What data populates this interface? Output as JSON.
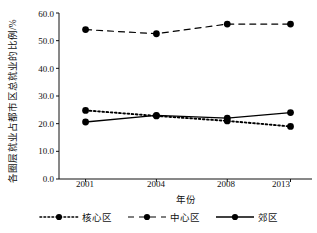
{
  "chart_data": {
    "type": "line",
    "title": "",
    "xlabel": "年份",
    "ylabel": "各圈层就业占都市区总就业的比例/%",
    "categories": [
      "2001",
      "2004",
      "2008",
      "2013"
    ],
    "ylim": [
      0.0,
      60.0
    ],
    "yticks": [
      "0.0",
      "10.0",
      "20.0",
      "30.0",
      "40.0",
      "50.0",
      "60.0"
    ],
    "ytick_values": [
      0.0,
      10.0,
      20.0,
      30.0,
      40.0,
      50.0,
      60.0
    ],
    "grid": false,
    "legend_position": "bottom",
    "marker": "filled-circle",
    "series": [
      {
        "name": "核心区",
        "line_style": "dotted",
        "color": "#000000",
        "values": [
          24.8,
          22.8,
          21.0,
          19.0
        ]
      },
      {
        "name": "中心区",
        "line_style": "dashed",
        "color": "#000000",
        "values": [
          54.0,
          52.5,
          56.0,
          56.0
        ]
      },
      {
        "name": "郊区",
        "line_style": "solid",
        "color": "#000000",
        "values": [
          20.6,
          23.0,
          22.0,
          24.0
        ]
      }
    ]
  },
  "axes": {
    "y_label_text": "各圈层就业占都市区总就业的比例/%",
    "x_label_text": "年份",
    "ytick_0": "0.0",
    "ytick_1": "10.0",
    "ytick_2": "20.0",
    "ytick_3": "30.0",
    "ytick_4": "40.0",
    "ytick_5": "50.0",
    "ytick_6": "60.0",
    "xtick_0": "2001",
    "xtick_1": "2004",
    "xtick_2": "2008",
    "xtick_3": "2013"
  },
  "legend": {
    "items": [
      {
        "label": "核心区",
        "style": "dotted"
      },
      {
        "label": "中心区",
        "style": "dashed"
      },
      {
        "label": "郊区",
        "style": "solid"
      }
    ]
  }
}
